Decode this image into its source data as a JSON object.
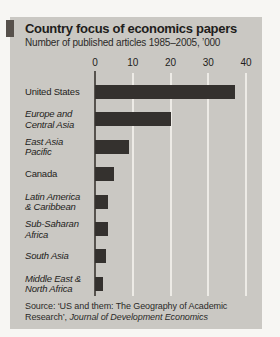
{
  "chart": {
    "title": "Country focus of economics papers",
    "subtitle": "Number of published articles 1985–2005, ’000"
  },
  "chart_data": {
    "type": "bar",
    "orientation": "horizontal",
    "title": "Country focus of economics papers",
    "subtitle": "Number of published articles 1985–2005, ’000",
    "xlabel": "Number of published articles, ’000",
    "ylabel": "",
    "xlim": [
      0,
      40
    ],
    "ticks": [
      0,
      10,
      20,
      30,
      40
    ],
    "grid": true,
    "legend": "none",
    "categories": [
      "United States",
      "Europe and Central Asia",
      "East Asia Pacific",
      "Canada",
      "Latin America & Caribbean",
      "Sub-Saharan Africa",
      "South Asia",
      "Middle East & North Africa"
    ],
    "values": [
      37,
      20,
      9,
      5,
      3.5,
      3.5,
      3,
      2
    ],
    "rows": [
      {
        "label_lines": [
          "United States"
        ],
        "value": 37,
        "italic": false
      },
      {
        "label_lines": [
          "Europe and",
          "Central Asia"
        ],
        "value": 20,
        "italic": true
      },
      {
        "label_lines": [
          "East Asia",
          "Pacific"
        ],
        "value": 9,
        "italic": true
      },
      {
        "label_lines": [
          "Canada"
        ],
        "value": 5,
        "italic": false
      },
      {
        "label_lines": [
          "Latin America",
          "& Caribbean"
        ],
        "value": 3.5,
        "italic": true
      },
      {
        "label_lines": [
          "Sub-Saharan",
          "Africa"
        ],
        "value": 3.5,
        "italic": true
      },
      {
        "label_lines": [
          "South Asia"
        ],
        "value": 3,
        "italic": true
      },
      {
        "label_lines": [
          "Middle East &",
          "North Africa"
        ],
        "value": 2,
        "italic": true
      }
    ],
    "source": {
      "prefix": "Source: ‘US and them: The Geography of Academic Research’, ",
      "journal": "Journal of Development Economics"
    },
    "colors": {
      "page_bg": "#f7f6f3",
      "panel_bg": "#cac8c3",
      "bar": "#34312e",
      "gridline": "#edebe6",
      "zero_axis": "#57534e",
      "text": "#1e1d1b",
      "tab": "#57514c"
    }
  }
}
